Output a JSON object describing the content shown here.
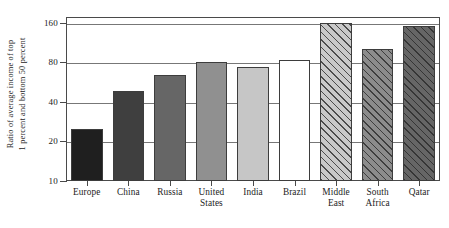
{
  "chart_data": {
    "type": "bar",
    "title": "",
    "subtitle": "",
    "xlabel": "",
    "ylabel": "Ratio of average income of top 1 percent and bottom 50 percent",
    "ylabel_line1": "Ratio of average income of top",
    "ylabel_line2": "1 percent and bottom 50 percent",
    "yscale": "log",
    "ylim": [
      10,
      170
    ],
    "yticks": [
      10,
      20,
      40,
      80,
      160
    ],
    "ytick_labels": [
      "10",
      "20",
      "40",
      "80",
      "160"
    ],
    "gridlines": [
      20,
      40,
      80,
      160
    ],
    "grid": true,
    "legend": "none",
    "categories": [
      "Europe",
      "China",
      "Russia",
      "United States",
      "India",
      "Brazil",
      "Middle East",
      "South Africa",
      "Qatar"
    ],
    "category_lines": [
      [
        "Europe"
      ],
      [
        "China"
      ],
      [
        "Russia"
      ],
      [
        "United",
        "States"
      ],
      [
        "India"
      ],
      [
        "Brazil"
      ],
      [
        "Middle",
        "East"
      ],
      [
        "South",
        "Africa"
      ],
      [
        "Qatar"
      ]
    ],
    "values": [
      25,
      48,
      64,
      80,
      73,
      83,
      160,
      100,
      150
    ],
    "bar_styles": [
      {
        "fill": "#1f1f1f",
        "hatch": false
      },
      {
        "fill": "#3f3f3f",
        "hatch": false
      },
      {
        "fill": "#666666",
        "hatch": false
      },
      {
        "fill": "#909090",
        "hatch": false
      },
      {
        "fill": "#c6c6c6",
        "hatch": false
      },
      {
        "fill": "#ffffff",
        "hatch": false
      },
      {
        "fill": "#c9c9c9",
        "hatch": true
      },
      {
        "fill": "#8c8c8c",
        "hatch": true
      },
      {
        "fill": "#666666",
        "hatch": true
      }
    ],
    "axis_color": "#4a4a4a",
    "grid_color": "#777777",
    "background": "#ffffff"
  }
}
